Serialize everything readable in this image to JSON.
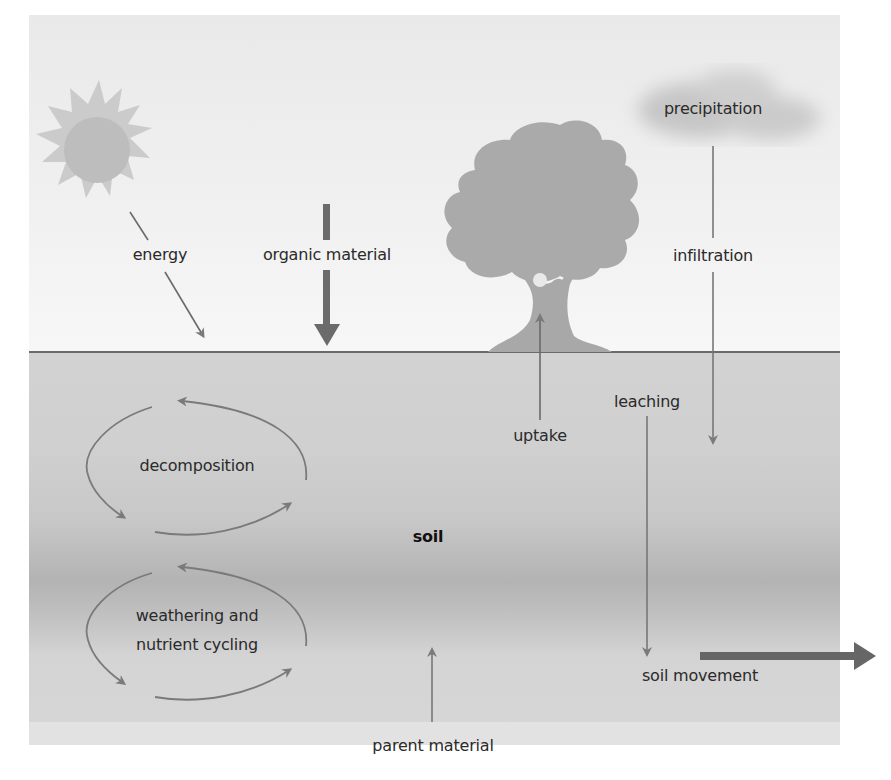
{
  "diagram": {
    "colors": {
      "sky": "#eeeeee",
      "soil": "#cfcfcf",
      "soil_dark_band": "#b3b3b3",
      "parent_material": "#e2e2e2",
      "ground_line": "#6a6a6a",
      "arrow": "#7a7a7a",
      "thick_arrow": "#6b6b6b",
      "sun": "#c4c4c4",
      "tree": "#a9a9a9",
      "cloud": "#c8c8c8",
      "text": "#2a2a2a"
    },
    "icons": {
      "sun": "sun-icon",
      "tree": "tree-icon",
      "cloud": "cloud-icon"
    },
    "labels": {
      "energy": "energy",
      "organic_material": "organic material",
      "precipitation": "precipitation",
      "infiltration": "infiltration",
      "uptake": "uptake",
      "leaching": "leaching",
      "decomposition": "decomposition",
      "soil": "soil",
      "weathering_line1": "weathering and",
      "weathering_line2": "nutrient cycling",
      "soil_movement": "soil movement",
      "parent_material": "parent material"
    },
    "zones": [
      "sky",
      "soil",
      "parent material"
    ]
  }
}
